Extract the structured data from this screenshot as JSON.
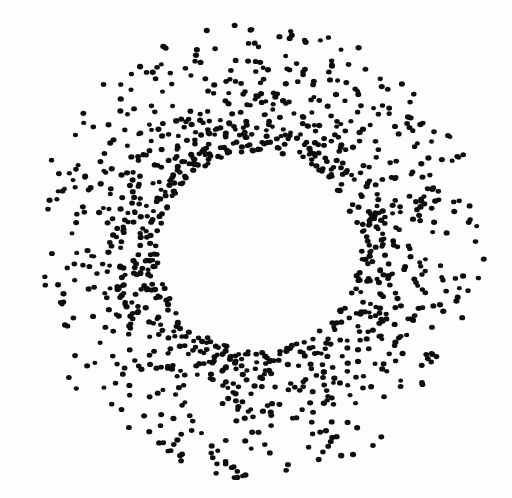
{
  "figure": {
    "domain_type": "chart",
    "background_color": "#fdfdfd",
    "width": 512,
    "height": 498
  },
  "chart_data": {
    "type": "scatter",
    "title": "",
    "subtitle": "",
    "xlabel": "",
    "ylabel": "",
    "grid": false,
    "axes_visible": false,
    "tick_labels_visible": false,
    "legend": null,
    "legend_position": "none",
    "annotations": [],
    "xlim": [
      0,
      512
    ],
    "ylim": [
      0,
      498
    ],
    "marker": {
      "shape": "ellipse",
      "color": "#0d0d0d",
      "width_px": 5.6,
      "height_px": 4.9,
      "size_jitter_px": 1.3,
      "edge": "none",
      "opacity": 1.0
    },
    "geometry": {
      "center_x": 258,
      "center_y": 251,
      "inner_void_radius": 100,
      "peak_density_radius": 108,
      "outer_radius": 228,
      "inner_edge_sharpness": "sharp",
      "outer_edge_sharpness": "diffuse"
    },
    "distribution": {
      "model": "radial_density_falloff",
      "n_points": 1120,
      "angular_distribution": "uniform",
      "radial_profile_note": "density(r) = 0 for r < 100; rises abruptly to maximum at r ~ 108; decays approximately as exp(-(r-108)/52) out to r ~ 228",
      "radial_bins": [
        {
          "r_inner": 0,
          "r_outer": 100,
          "count": 0,
          "relative_density": 0.0
        },
        {
          "r_inner": 100,
          "r_outer": 112,
          "count": 196,
          "relative_density": 1.0
        },
        {
          "r_inner": 112,
          "r_outer": 125,
          "count": 178,
          "relative_density": 0.8
        },
        {
          "r_inner": 125,
          "r_outer": 140,
          "count": 165,
          "relative_density": 0.6
        },
        {
          "r_inner": 140,
          "r_outer": 156,
          "count": 148,
          "relative_density": 0.45
        },
        {
          "r_inner": 156,
          "r_outer": 173,
          "count": 130,
          "relative_density": 0.33
        },
        {
          "r_inner": 173,
          "r_outer": 191,
          "count": 108,
          "relative_density": 0.23
        },
        {
          "r_inner": 191,
          "r_outer": 210,
          "count": 106,
          "relative_density": 0.15
        },
        {
          "r_inner": 210,
          "r_outer": 228,
          "count": 89,
          "relative_density": 0.09
        }
      ],
      "extent_px": {
        "leftmost_dot_x": 33,
        "rightmost_dot_x": 480,
        "topmost_dot_y": 33,
        "bottommost_dot_y": 470
      },
      "random_seed": 20250418
    }
  }
}
